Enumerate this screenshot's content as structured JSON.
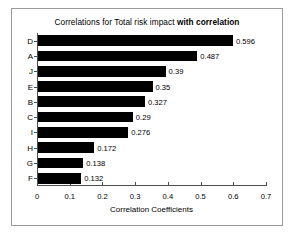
{
  "chart_data": {
    "type": "bar",
    "orientation": "horizontal",
    "title": "Correlations for Total risk impact with correlation",
    "title_plain": "Correlations for Total risk impact ",
    "title_bold": "with correlation",
    "categories": [
      "D",
      "A",
      "J",
      "E",
      "B",
      "C",
      "I",
      "H",
      "G",
      "F"
    ],
    "values": [
      0.596,
      0.487,
      0.39,
      0.35,
      0.327,
      0.29,
      0.276,
      0.172,
      0.138,
      0.132
    ],
    "value_labels": [
      "0.596",
      "0.487",
      "0.39",
      "0.35",
      "0.327",
      "0.29",
      "0.276",
      "0.172",
      "0.138",
      "0.132"
    ],
    "xlabel": "Correlation Coefficients",
    "ylabel": "",
    "xlim": [
      0,
      0.7
    ],
    "xticks": [
      0,
      0.1,
      0.2,
      0.3,
      0.4,
      0.5,
      0.6,
      0.7
    ],
    "xtick_labels": [
      "0",
      "0.1",
      "0.2",
      "0.3",
      "0.4",
      "0.5",
      "0.6",
      "0.7"
    ],
    "grid": false,
    "legend": false,
    "bar_color": "#000000",
    "axis_color": "#4d4d4d",
    "border_color": "#9a9a9a",
    "background": "#ffffff"
  }
}
